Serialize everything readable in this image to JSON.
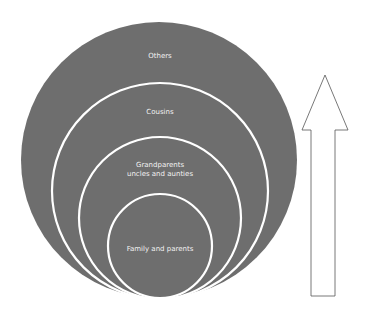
{
  "diagram": {
    "type": "concentric-circles",
    "fill_color": "#6e6e6e",
    "ring_color": "#ffffff",
    "text_color": "#f2f2f2",
    "circles": [
      {
        "id": "others",
        "label": "Others",
        "label_line2": "",
        "cx": 159,
        "cy": 160,
        "r": 138
      },
      {
        "id": "cousins",
        "label": "Cousins",
        "label_line2": "",
        "cx": 160,
        "cy": 190,
        "r": 108
      },
      {
        "id": "grandparents",
        "label": "Grandparents",
        "label_line2": "uncles and aunties",
        "cx": 160,
        "cy": 217,
        "r": 81
      },
      {
        "id": "family",
        "label": "Family and parents",
        "label_line2": "",
        "cx": 160,
        "cy": 246,
        "r": 52
      }
    ],
    "arrow": {
      "direction": "up",
      "fill": "#ffffff",
      "stroke": "#555555"
    }
  }
}
